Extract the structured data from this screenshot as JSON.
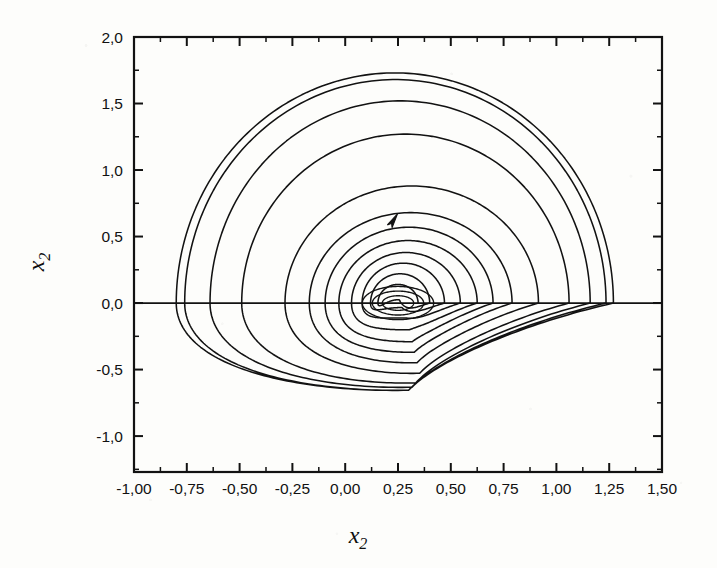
{
  "figure": {
    "background_color": "#fdfdfb",
    "ink_color": "#121212"
  },
  "axes": {
    "x_title": "x",
    "x_title_sub": "2",
    "y_title": "x",
    "y_title_sub": "2",
    "x_tick_labels": [
      "-1,00",
      "-0,75",
      "-0,50",
      "-0,25",
      "0,00",
      "0,25",
      "0,50",
      "0,75",
      "1,00",
      "1,25",
      "1,50"
    ],
    "y_tick_labels": [
      "2,0",
      "1,5",
      "1,0",
      "0,5",
      "0,0",
      "-0,5",
      "-1,0"
    ]
  },
  "chart_data": {
    "type": "line",
    "title": "",
    "subtitle": "",
    "xlabel": "x2",
    "ylabel": "x2",
    "xlim": [
      -1.0,
      1.5
    ],
    "ylim": [
      -1.27,
      2.0
    ],
    "x_ticks": [
      -1.0,
      -0.75,
      -0.5,
      -0.25,
      0.0,
      0.25,
      0.5,
      0.75,
      1.0,
      1.25,
      1.5
    ],
    "y_ticks": [
      2.0,
      1.5,
      1.0,
      0.5,
      0.0,
      -0.5,
      -1.0
    ],
    "x_tick_labels": [
      "-1,00",
      "-0,75",
      "-0,50",
      "-0,25",
      "0,00",
      "0,25",
      "0,50",
      "0,75",
      "1,00",
      "1,25",
      "1,50"
    ],
    "y_tick_labels": [
      "2,0",
      "1,5",
      "1,0",
      "0,5",
      "0,0",
      "-0,5",
      "-1,0"
    ],
    "x_minor_tick_step": 0.125,
    "y_minor_tick_step": 0.25,
    "grid": false,
    "legend": false,
    "tick_direction": "in",
    "frame": "box-all-sides",
    "zero_line": {
      "y": 0.0,
      "from_x": -1.0,
      "to_x": 1.5,
      "drawn": true
    },
    "direction_arrow": {
      "x": 0.22,
      "y": 0.6,
      "angle_deg": -58,
      "meaning": "direction of motion, counter-clockwise/outward"
    },
    "focus": {
      "x": 0.25,
      "y": 0.0
    },
    "extents": {
      "x_min": -0.8,
      "x_max": 1.27,
      "y_min": -0.78,
      "y_max": 1.73
    },
    "series": [
      {
        "name": "trajectory",
        "loops": [
          {
            "index": 1,
            "y_top": 0.14,
            "x_left": 0.155,
            "x_right": 0.345,
            "y_bottom": -0.1
          },
          {
            "index": 2,
            "y_top": 0.22,
            "x_left": 0.12,
            "x_right": 0.4,
            "y_bottom": -0.16
          },
          {
            "index": 3,
            "y_top": 0.3,
            "x_left": 0.08,
            "x_right": 0.47,
            "y_bottom": -0.24
          },
          {
            "index": 4,
            "y_top": 0.38,
            "x_left": 0.03,
            "x_right": 0.545,
            "y_bottom": -0.33
          },
          {
            "index": 5,
            "y_top": 0.47,
            "x_left": -0.03,
            "x_right": 0.625,
            "y_bottom": -0.42
          },
          {
            "index": 6,
            "y_top": 0.57,
            "x_left": -0.095,
            "x_right": 0.7,
            "y_bottom": -0.5
          },
          {
            "index": 7,
            "y_top": 0.68,
            "x_left": -0.17,
            "x_right": 0.79,
            "y_bottom": -0.58
          },
          {
            "index": 8,
            "y_top": 0.88,
            "x_left": -0.285,
            "x_right": 0.915,
            "y_bottom": -0.66
          },
          {
            "index": 9,
            "y_top": 1.27,
            "x_left": -0.49,
            "x_right": 1.06,
            "y_bottom": -0.73
          },
          {
            "index": 10,
            "y_top": 1.52,
            "x_left": -0.64,
            "x_right": 1.16,
            "y_bottom": -0.76
          },
          {
            "index": 11,
            "y_top": 1.68,
            "x_left": -0.76,
            "x_right": 1.235,
            "y_bottom": -0.78
          },
          {
            "index": 12,
            "y_top": 1.73,
            "x_left": -0.8,
            "x_right": 1.27,
            "y_bottom": -0.78
          }
        ],
        "impact_points_x": [
          0.36,
          0.42,
          0.5,
          0.58,
          0.66,
          0.74,
          0.83,
          0.95,
          1.08,
          1.17,
          1.24,
          1.27
        ]
      }
    ]
  }
}
